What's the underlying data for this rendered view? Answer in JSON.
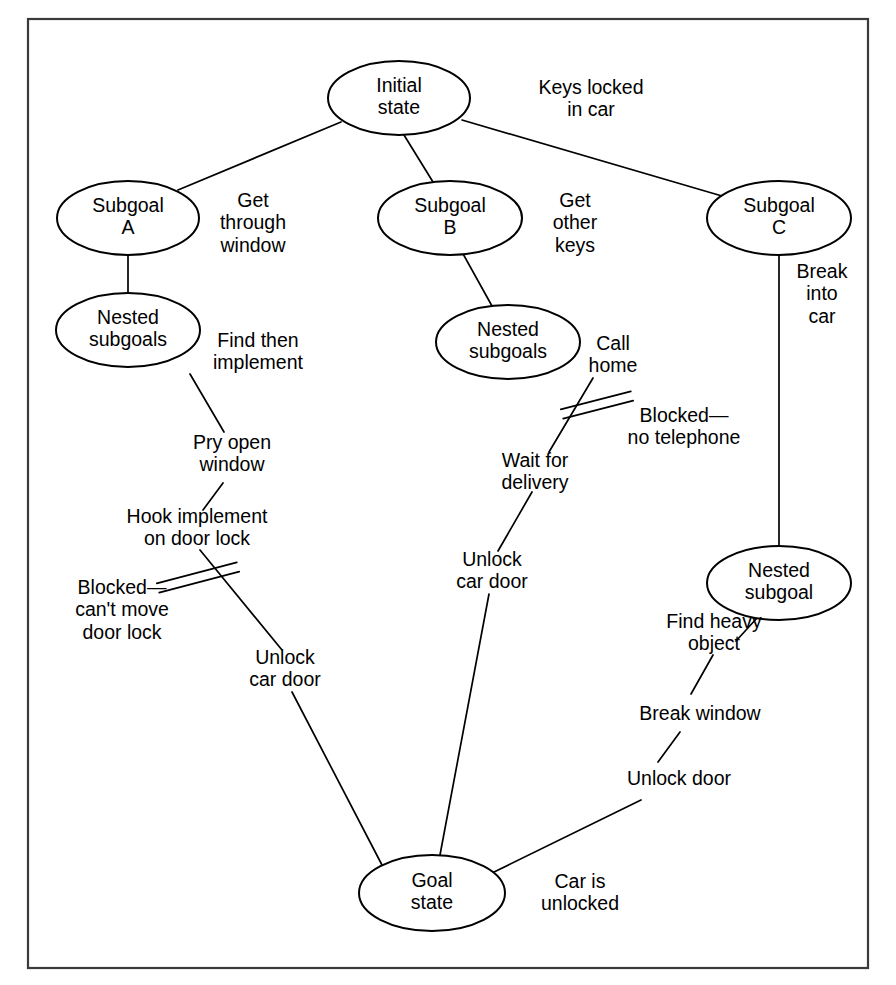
{
  "diagram": {
    "frame": {
      "x": 28,
      "y": 19,
      "width": 840,
      "height": 949
    },
    "colors": {
      "stroke": "#000000",
      "frame": "#3a3a3a",
      "background": "#ffffff"
    },
    "nodes": [
      {
        "id": "initial-state",
        "lines": [
          "Initial",
          "state"
        ],
        "cx": 399,
        "cy": 98,
        "rx": 71,
        "ry": 37
      },
      {
        "id": "subgoal-a",
        "lines": [
          "Subgoal",
          "A"
        ],
        "cx": 128,
        "cy": 218,
        "rx": 71,
        "ry": 37
      },
      {
        "id": "nested-subgoals-a",
        "lines": [
          "Nested",
          "subgoals"
        ],
        "cx": 128,
        "cy": 330,
        "rx": 72,
        "ry": 37
      },
      {
        "id": "subgoal-b",
        "lines": [
          "Subgoal",
          "B"
        ],
        "cx": 450,
        "cy": 218,
        "rx": 72,
        "ry": 37
      },
      {
        "id": "nested-subgoals-b",
        "lines": [
          "Nested",
          "subgoals"
        ],
        "cx": 508,
        "cy": 342,
        "rx": 72,
        "ry": 37
      },
      {
        "id": "subgoal-c",
        "lines": [
          "Subgoal",
          "C"
        ],
        "cx": 779,
        "cy": 218,
        "rx": 72,
        "ry": 37
      },
      {
        "id": "nested-subgoal-c",
        "lines": [
          "Nested",
          "subgoal"
        ],
        "cx": 779,
        "cy": 583,
        "rx": 72,
        "ry": 37
      },
      {
        "id": "goal-state",
        "lines": [
          "Goal",
          "state"
        ],
        "cx": 432,
        "cy": 893,
        "rx": 73,
        "ry": 38
      }
    ],
    "edge_labels": [
      {
        "id": "keys-locked-in-car",
        "lines": [
          "Keys locked",
          "in car"
        ],
        "x": 591,
        "y": 100,
        "align": "center"
      },
      {
        "id": "get-through-window",
        "lines": [
          "Get",
          "through",
          "window"
        ],
        "x": 253,
        "y": 224,
        "align": "center"
      },
      {
        "id": "find-then-implement",
        "lines": [
          "Find then",
          "implement"
        ],
        "x": 258,
        "y": 353,
        "align": "center"
      },
      {
        "id": "pry-open-window",
        "lines": [
          "Pry open",
          "window"
        ],
        "x": 232,
        "y": 455,
        "align": "center"
      },
      {
        "id": "hook-implement-on-door-lock",
        "lines": [
          "Hook implement",
          "on door lock"
        ],
        "x": 197,
        "y": 529,
        "align": "center"
      },
      {
        "id": "blocked-cant-move-door-lock",
        "lines": [
          "Blocked—",
          "can't move",
          "door lock"
        ],
        "x": 122,
        "y": 611,
        "align": "center"
      },
      {
        "id": "unlock-car-door-left",
        "lines": [
          "Unlock",
          "car door"
        ],
        "x": 285,
        "y": 670,
        "align": "center"
      },
      {
        "id": "get-other-keys",
        "lines": [
          "Get",
          "other",
          "keys"
        ],
        "x": 575,
        "y": 224,
        "align": "center"
      },
      {
        "id": "call-home",
        "lines": [
          "Call",
          "home"
        ],
        "x": 613,
        "y": 356,
        "align": "center"
      },
      {
        "id": "blocked-no-telephone",
        "lines": [
          "Blocked—",
          "no telephone"
        ],
        "x": 684,
        "y": 428,
        "align": "center"
      },
      {
        "id": "wait-for-delivery",
        "lines": [
          "Wait for",
          "delivery"
        ],
        "x": 535,
        "y": 473,
        "align": "center"
      },
      {
        "id": "unlock-car-door-mid",
        "lines": [
          "Unlock",
          "car door"
        ],
        "x": 492,
        "y": 572,
        "align": "center"
      },
      {
        "id": "break-into-car",
        "lines": [
          "Break",
          "into",
          "car"
        ],
        "x": 822,
        "y": 295,
        "align": "center"
      },
      {
        "id": "find-heavy-object",
        "lines": [
          "Find heavy",
          "object"
        ],
        "x": 714,
        "y": 634,
        "align": "center"
      },
      {
        "id": "break-window",
        "lines": [
          "Break window"
        ],
        "x": 700,
        "y": 715,
        "align": "center"
      },
      {
        "id": "unlock-door",
        "lines": [
          "Unlock door"
        ],
        "x": 679,
        "y": 780,
        "align": "center"
      },
      {
        "id": "car-is-unlocked",
        "lines": [
          "Car is",
          "unlocked"
        ],
        "x": 580,
        "y": 894,
        "align": "center"
      }
    ],
    "edges": [
      {
        "id": "edge-initial-to-subgoal-a",
        "from": "initial-state",
        "to": "subgoal-a",
        "x1": 341,
        "y1": 122,
        "x2": 178,
        "y2": 190
      },
      {
        "id": "edge-initial-to-subgoal-b",
        "from": "initial-state",
        "to": "subgoal-b",
        "x1": 404,
        "y1": 135,
        "x2": 433,
        "y2": 182
      },
      {
        "id": "edge-initial-to-subgoal-c",
        "from": "initial-state",
        "to": "subgoal-c",
        "x1": 462,
        "y1": 120,
        "x2": 722,
        "y2": 196
      },
      {
        "id": "edge-subgoal-a-to-nested-a",
        "from": "subgoal-a",
        "to": "nested-subgoals-a",
        "x1": 128,
        "y1": 255,
        "x2": 128,
        "y2": 293
      },
      {
        "id": "edge-nested-a-to-pry",
        "from": "nested-subgoals-a",
        "to": "pry-open-window",
        "x1": 190,
        "y1": 374,
        "x2": 224,
        "y2": 432
      },
      {
        "id": "edge-pry-to-hook",
        "from": "pry-open-window",
        "to": "hook-implement",
        "x1": 223,
        "y1": 483,
        "x2": 203,
        "y2": 510
      },
      {
        "id": "edge-hook-to-unlock-left",
        "from": "hook-implement",
        "to": "unlock-car-door-left",
        "x1": 200,
        "y1": 550,
        "x2": 282,
        "y2": 650
      },
      {
        "id": "edge-unlock-left-to-goal",
        "from": "unlock-car-door-left",
        "to": "goal-state",
        "x1": 292,
        "y1": 692,
        "x2": 382,
        "y2": 865
      },
      {
        "id": "edge-subgoal-b-to-nested-b",
        "from": "subgoal-b",
        "to": "nested-subgoals-b",
        "x1": 462,
        "y1": 252,
        "x2": 492,
        "y2": 306
      },
      {
        "id": "edge-nested-b-to-wait",
        "from": "nested-subgoals-b",
        "to": "wait-for-delivery",
        "x1": 593,
        "y1": 378,
        "x2": 549,
        "y2": 452
      },
      {
        "id": "edge-wait-to-unlock-mid",
        "from": "wait-for-delivery",
        "to": "unlock-car-door-mid",
        "x1": 532,
        "y1": 492,
        "x2": 498,
        "y2": 551
      },
      {
        "id": "edge-unlock-mid-to-goal",
        "from": "unlock-car-door-mid",
        "to": "goal-state",
        "x1": 489,
        "y1": 594,
        "x2": 440,
        "y2": 855
      },
      {
        "id": "edge-subgoal-c-to-nested-c",
        "from": "subgoal-c",
        "to": "nested-subgoal-c",
        "x1": 779,
        "y1": 255,
        "x2": 779,
        "y2": 546
      },
      {
        "id": "edge-nested-c-to-find-heavy",
        "from": "nested-subgoal-c",
        "to": "find-heavy-object",
        "x1": 757,
        "y1": 618,
        "x2": 736,
        "y2": 641
      },
      {
        "id": "edge-find-heavy-to-break-window",
        "from": "find-heavy-object",
        "to": "break-window",
        "x1": 713,
        "y1": 655,
        "x2": 691,
        "y2": 694
      },
      {
        "id": "edge-break-window-to-unlock-door",
        "from": "break-window",
        "to": "unlock-door",
        "x1": 680,
        "y1": 732,
        "x2": 658,
        "y2": 762
      },
      {
        "id": "edge-unlock-door-to-goal",
        "from": "unlock-door",
        "to": "goal-state",
        "x1": 641,
        "y1": 800,
        "x2": 492,
        "y2": 873
      }
    ],
    "blocked_markers": [
      {
        "id": "blocked-marker-left",
        "x1": 158,
        "y1": 588,
        "x2": 238,
        "y2": 567,
        "offset": 6
      },
      {
        "id": "blocked-marker-middle",
        "x1": 562,
        "y1": 414,
        "x2": 632,
        "y2": 396,
        "offset": 6
      }
    ]
  }
}
